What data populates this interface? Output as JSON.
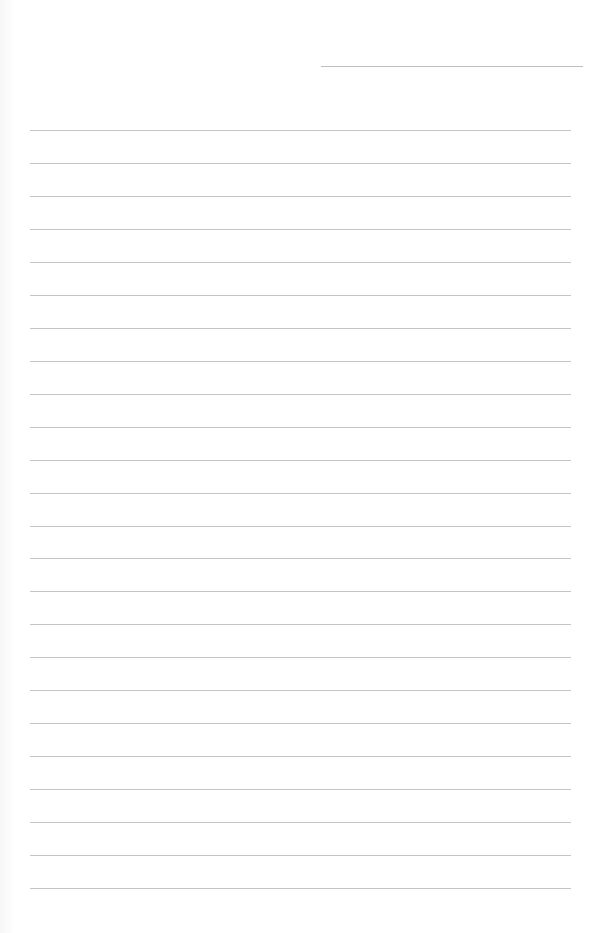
{
  "page": {
    "type": "lined-paper",
    "background_color": "#ffffff",
    "line_color": "#c4c4c4",
    "header_line": {
      "x_start": 321,
      "x_end": 583,
      "y": 66
    },
    "ruled_lines": {
      "count": 24,
      "first_y": 130,
      "spacing": 32.96,
      "x_start": 30,
      "x_end": 571
    }
  }
}
